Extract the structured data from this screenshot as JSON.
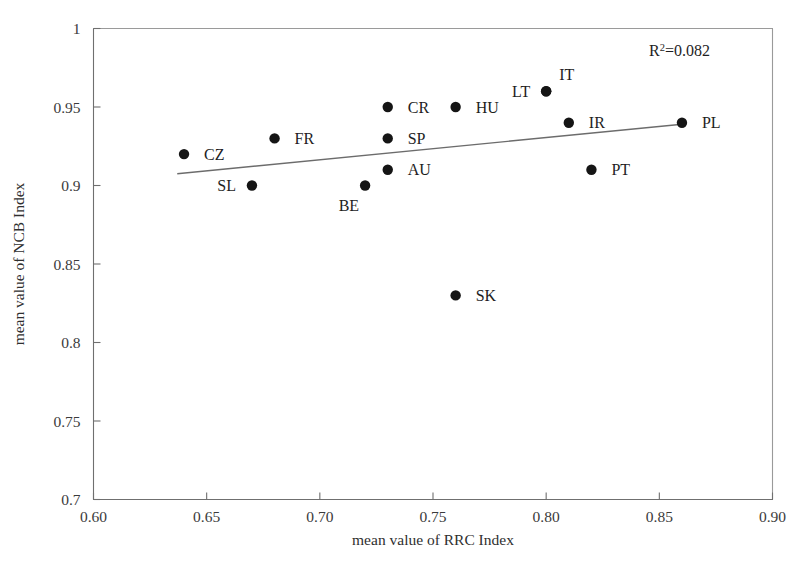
{
  "chart_data": {
    "type": "scatter",
    "title": "",
    "xlabel": "mean value of RRC Index",
    "ylabel": "mean value of NCB Index",
    "xlim": [
      0.6,
      0.9
    ],
    "ylim": [
      0.7,
      1.0
    ],
    "xticks": [
      "0.60",
      "0.65",
      "0.70",
      "0.75",
      "0.80",
      "0.85",
      "0.90"
    ],
    "xtick_values": [
      0.6,
      0.65,
      0.7,
      0.75,
      0.8,
      0.85,
      0.9
    ],
    "yticks": [
      "0.7",
      "0.75",
      "0.8",
      "0.85",
      "0.9",
      "0.95",
      "1"
    ],
    "ytick_values": [
      0.7,
      0.75,
      0.8,
      0.85,
      0.9,
      0.95,
      1.0
    ],
    "grid": false,
    "legend": false,
    "annotations": [
      {
        "name": "r-squared",
        "text_prefix": "R",
        "text_sup": "2",
        "text_suffix": "=0.082",
        "value": 0.082
      }
    ],
    "trendline": {
      "type": "linear",
      "x_start": 0.637,
      "y_start": 0.9075,
      "x_end": 0.86,
      "y_end": 0.939
    },
    "points": [
      {
        "label": "CZ",
        "x": 0.64,
        "y": 0.92,
        "label_pos": "right"
      },
      {
        "label": "SL",
        "x": 0.67,
        "y": 0.9,
        "label_pos": "left"
      },
      {
        "label": "FR",
        "x": 0.68,
        "y": 0.93,
        "label_pos": "right"
      },
      {
        "label": "BE",
        "x": 0.72,
        "y": 0.9,
        "label_pos": "below-left"
      },
      {
        "label": "CR",
        "x": 0.73,
        "y": 0.95,
        "label_pos": "right"
      },
      {
        "label": "SP",
        "x": 0.73,
        "y": 0.93,
        "label_pos": "right"
      },
      {
        "label": "AU",
        "x": 0.73,
        "y": 0.91,
        "label_pos": "right"
      },
      {
        "label": "HU",
        "x": 0.76,
        "y": 0.95,
        "label_pos": "right"
      },
      {
        "label": "SK",
        "x": 0.76,
        "y": 0.83,
        "label_pos": "right"
      },
      {
        "label": "LT",
        "x": 0.8,
        "y": 0.96,
        "label_pos": "left"
      },
      {
        "label": "IT",
        "x": 0.8,
        "y": 0.96,
        "label_pos": "upper-right"
      },
      {
        "label": "IR",
        "x": 0.81,
        "y": 0.94,
        "label_pos": "right"
      },
      {
        "label": "PT",
        "x": 0.82,
        "y": 0.91,
        "label_pos": "right"
      },
      {
        "label": "PL",
        "x": 0.86,
        "y": 0.94,
        "label_pos": "right"
      }
    ],
    "colors": {
      "marker": "#151515",
      "axis": "#6f6f6f",
      "frame": "#9a9a9a",
      "trendline": "#6c6c6c",
      "text": "#3b3b3b",
      "background": "#ffffff"
    }
  }
}
